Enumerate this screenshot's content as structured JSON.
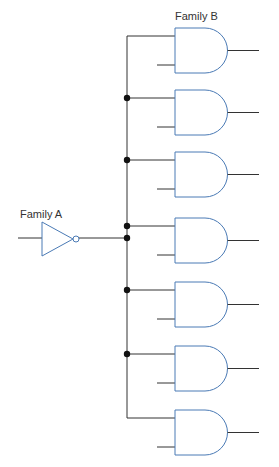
{
  "labels": {
    "family_a": "Family A",
    "family_b": "Family B"
  },
  "colors": {
    "wire": "#333333",
    "gate": "#4a7ab5"
  },
  "inverter": {
    "name": "Family A inverter",
    "input_y": 238
  },
  "and_gates": [
    {
      "index": 1,
      "top_input_y": 36
    },
    {
      "index": 2,
      "top_input_y": 98
    },
    {
      "index": 3,
      "top_input_y": 160
    },
    {
      "index": 4,
      "top_input_y": 226
    },
    {
      "index": 5,
      "top_input_y": 290
    },
    {
      "index": 6,
      "top_input_y": 354
    },
    {
      "index": 7,
      "top_input_y": 418
    }
  ],
  "junction_dots_y": [
    98,
    160,
    226,
    238,
    290,
    354
  ]
}
